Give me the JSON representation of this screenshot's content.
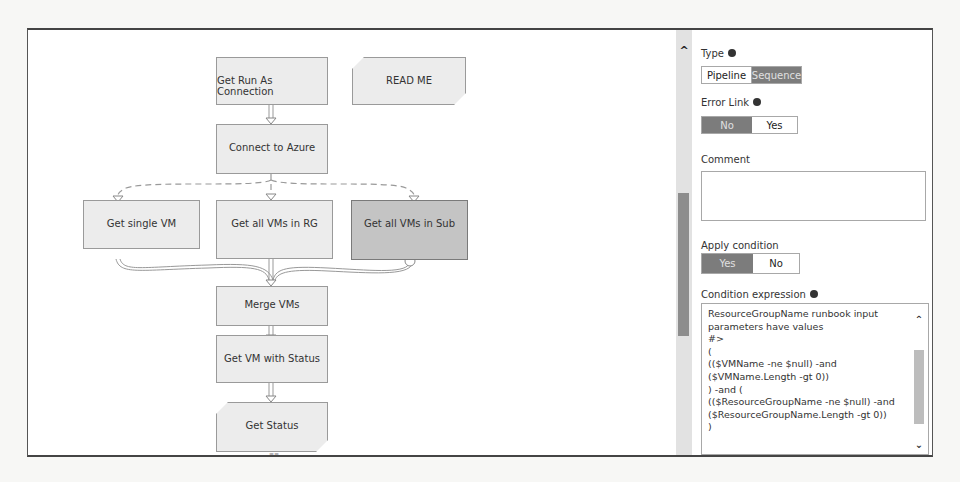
{
  "workflow": {
    "nodes": [
      {
        "id": "get-run-as-connection",
        "label": "Get Run As Connection"
      },
      {
        "id": "read-me",
        "label": "READ ME"
      },
      {
        "id": "connect-to-azure",
        "label": "Connect to Azure"
      },
      {
        "id": "get-single-vm",
        "label": "Get single VM"
      },
      {
        "id": "get-all-vms-in-rg",
        "label": "Get all VMs in RG"
      },
      {
        "id": "get-all-vms-in-sub",
        "label": "Get all VMs in Sub",
        "selected": true
      },
      {
        "id": "merge-vms",
        "label": "Merge VMs"
      },
      {
        "id": "get-vm-with-status",
        "label": "Get VM with Status"
      },
      {
        "id": "get-status",
        "label": "Get Status"
      }
    ]
  },
  "properties": {
    "type": {
      "label": "Type",
      "options": [
        "Pipeline",
        "Sequence"
      ],
      "selected": "Sequence"
    },
    "error_link": {
      "label": "Error Link",
      "options": [
        "No",
        "Yes"
      ],
      "selected": "No"
    },
    "comment": {
      "label": "Comment",
      "value": ""
    },
    "apply_condition": {
      "label": "Apply condition",
      "options": [
        "Yes",
        "No"
      ],
      "selected": "Yes"
    },
    "condition_expression": {
      "label": "Condition expression",
      "value": "ResourceGroupName runbook input\nparameters have values\n#>\n(\n(($VMName -ne $null) -and\n($VMName.Length -gt 0))\n) -and (\n(($ResourceGroupName -ne $null) -and\n($ResourceGroupName.Length -gt 0))\n)"
    }
  },
  "colors": {
    "node_fill": "#ececec",
    "node_selected_fill": "#c4c4c4",
    "toggle_on": "#7c7c7c",
    "scroll_thumb": "#8d8d8d"
  }
}
